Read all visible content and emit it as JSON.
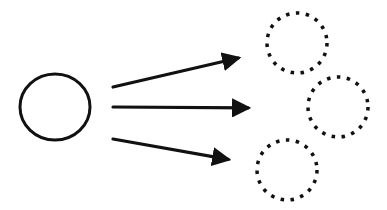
{
  "diagram": {
    "colors": {
      "stroke": "#111111",
      "background": "#ffffff"
    },
    "source_node": {
      "shape": "circle",
      "style": "solid",
      "cx": 55,
      "cy": 107,
      "rx": 35,
      "ry": 33
    },
    "target_nodes": [
      {
        "shape": "circle",
        "style": "dotted",
        "cx": 297,
        "cy": 43,
        "r": 30
      },
      {
        "shape": "circle",
        "style": "dotted",
        "cx": 338,
        "cy": 107,
        "r": 30
      },
      {
        "shape": "circle",
        "style": "dotted",
        "cx": 287,
        "cy": 170,
        "r": 30
      }
    ],
    "arrows": [
      {
        "x1": 113,
        "y1": 87,
        "x2": 247,
        "y2": 56
      },
      {
        "x1": 113,
        "y1": 107,
        "x2": 257,
        "y2": 108
      },
      {
        "x1": 113,
        "y1": 139,
        "x2": 237,
        "y2": 161
      }
    ]
  }
}
